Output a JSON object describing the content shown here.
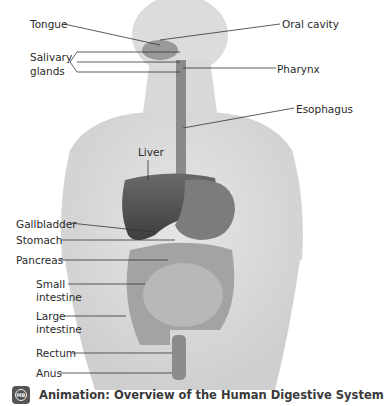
{
  "diagram": {
    "title": "Human Digestive System",
    "labels": {
      "tongue": "Tongue",
      "oral_cavity": "Oral cavity",
      "salivary_1": "Salivary",
      "salivary_2": "glands",
      "pharynx": "Pharynx",
      "esophagus": "Esophagus",
      "liver": "Liver",
      "gallbladder": "Gallbladder",
      "stomach": "Stomach",
      "pancreas": "Pancreas",
      "small_1": "Small",
      "small_2": "intestine",
      "large_1": "Large",
      "large_2": "intestine",
      "rectum": "Rectum",
      "anus": "Anus"
    }
  },
  "caption": {
    "icon": "animation-icon",
    "text": "Animation: Overview of the Human Digestive System"
  }
}
